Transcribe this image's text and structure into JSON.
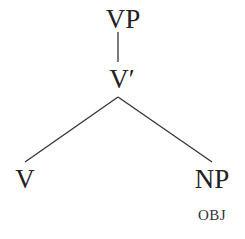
{
  "diagram": {
    "type": "syntax-tree",
    "colors": {
      "background": "#ffffff",
      "line": "#333333",
      "text": "#222222"
    },
    "nodes": {
      "root": {
        "label": "VP"
      },
      "bar": {
        "label": "V′"
      },
      "head": {
        "label": "V"
      },
      "complement": {
        "label": "NP",
        "feature": "OBJ"
      }
    },
    "edges": [
      {
        "from": "VP",
        "to": "V′"
      },
      {
        "from": "V′",
        "to": "V"
      },
      {
        "from": "V′",
        "to": "NP"
      }
    ]
  }
}
